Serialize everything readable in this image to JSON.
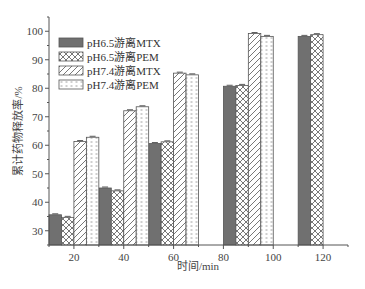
{
  "chart_data": {
    "type": "bar",
    "title": "",
    "xlabel": "时间/min",
    "ylabel": "累计药物释放率/%",
    "xlim": [
      10,
      130
    ],
    "ylim": [
      25,
      105
    ],
    "x_ticks": [
      20,
      40,
      60,
      80,
      100,
      120
    ],
    "y_ticks": [
      30,
      40,
      50,
      60,
      70,
      80,
      90,
      100
    ],
    "bar_width": 5,
    "grid": false,
    "legend_position": "upper left",
    "series": [
      {
        "name": "pH6.5游离MTX",
        "pattern": "solid-gray",
        "points": [
          {
            "x": 12.5,
            "value": 35.6
          },
          {
            "x": 32.5,
            "value": 45.0
          },
          {
            "x": 52.5,
            "value": 60.6
          },
          {
            "x": 82.5,
            "value": 80.7
          },
          {
            "x": 112.5,
            "value": 98.2
          }
        ]
      },
      {
        "name": "pH6.5游离PEM",
        "pattern": "crosshatch",
        "points": [
          {
            "x": 17.5,
            "value": 34.7
          },
          {
            "x": 37.5,
            "value": 44.0
          },
          {
            "x": 57.5,
            "value": 61.2
          },
          {
            "x": 87.5,
            "value": 81.0
          },
          {
            "x": 117.5,
            "value": 98.8
          }
        ]
      },
      {
        "name": "pH7.4游离MTX",
        "pattern": "diagonal",
        "points": [
          {
            "x": 22.5,
            "value": 61.3
          },
          {
            "x": 42.5,
            "value": 72.1
          },
          {
            "x": 62.5,
            "value": 85.3
          },
          {
            "x": 92.5,
            "value": 99.2
          }
        ]
      },
      {
        "name": "pH7.4游离PEM",
        "pattern": "dotted",
        "points": [
          {
            "x": 27.5,
            "value": 62.8
          },
          {
            "x": 47.5,
            "value": 73.5
          },
          {
            "x": 67.5,
            "value": 84.7
          },
          {
            "x": 97.5,
            "value": 98.2
          }
        ]
      }
    ]
  }
}
